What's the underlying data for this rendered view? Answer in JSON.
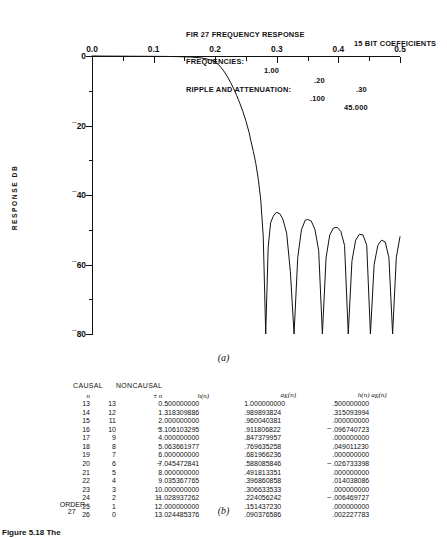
{
  "header": {
    "title": "FIR 27 FREQUENCY RESPONSE",
    "coefficients": "15 BIT COEFFICIENTS",
    "frequencies_label": "FREQUENCIES:",
    "frequencies": [
      "1.00",
      ".20",
      ".30"
    ],
    "ripple_label": "RIPPLE AND ATTENUATION:",
    "ripple": ".100",
    "attenuation": "45.000"
  },
  "figure_a_caption": "(a)",
  "figure_b_caption": "(b)",
  "bottom_caption": "Figure 5.18 The",
  "chart_data": {
    "type": "line",
    "title": "FIR 27 FREQUENCY RESPONSE",
    "xlabel": "",
    "ylabel": "RESPONSE DB",
    "xlim": [
      0.0,
      0.5
    ],
    "ylim": [
      -80,
      0
    ],
    "xticks": [
      "0.0",
      "0.1",
      "0.2",
      "0.3",
      "0.4",
      "0.5"
    ],
    "xtick_values": [
      0.0,
      0.1,
      0.2,
      0.3,
      0.4,
      0.5
    ],
    "yticks": [
      "0",
      "-20",
      "-40",
      "-60",
      "-80"
    ],
    "ytick_values": [
      0,
      -20,
      -40,
      -60,
      -80
    ],
    "grid": false,
    "legend": null,
    "passband_edge": 0.2,
    "stopband_edge": 0.3,
    "stopband_attenuation_db": -45,
    "passband_ripple_db": 0.1,
    "series": [
      {
        "name": "magnitude response",
        "x": [
          0.0,
          0.02,
          0.04,
          0.06,
          0.08,
          0.1,
          0.12,
          0.14,
          0.16,
          0.175,
          0.185,
          0.195,
          0.2,
          0.205,
          0.21,
          0.215,
          0.22,
          0.225,
          0.23,
          0.235,
          0.24,
          0.245,
          0.25,
          0.255,
          0.258,
          0.262,
          0.266,
          0.27,
          0.274,
          0.278,
          0.282,
          0.286,
          0.29,
          0.294,
          0.298,
          0.3,
          0.305,
          0.31,
          0.316,
          0.322,
          0.328,
          0.334,
          0.34,
          0.346,
          0.35,
          0.356,
          0.362,
          0.368,
          0.374,
          0.38,
          0.386,
          0.392,
          0.398,
          0.404,
          0.41,
          0.416,
          0.422,
          0.428,
          0.434,
          0.44,
          0.446,
          0.452,
          0.458,
          0.464,
          0.47,
          0.476,
          0.482,
          0.488,
          0.494,
          0.5
        ],
        "y": [
          0.0,
          -0.02,
          -0.04,
          -0.06,
          -0.08,
          -0.1,
          -0.12,
          -0.18,
          -0.3,
          -0.5,
          -0.8,
          -1.3,
          -1.7,
          -2.4,
          -3.4,
          -4.6,
          -6.0,
          -7.6,
          -9.4,
          -11.4,
          -13.6,
          -16.0,
          -18.8,
          -22.0,
          -24.5,
          -27.5,
          -31.0,
          -35.5,
          -41.5,
          -52.0,
          -80.0,
          -55.0,
          -48.0,
          -46.2,
          -45.2,
          -45.0,
          -45.4,
          -47.0,
          -51.0,
          -62.0,
          -80.0,
          -58.0,
          -50.0,
          -47.3,
          -47.0,
          -47.5,
          -50.0,
          -56.0,
          -80.0,
          -58.0,
          -51.5,
          -49.5,
          -49.3,
          -50.5,
          -54.5,
          -80.0,
          -59.0,
          -53.0,
          -51.3,
          -51.5,
          -54.5,
          -80.0,
          -60.0,
          -54.5,
          -53.0,
          -53.5,
          -58.0,
          -80.0,
          -58.0,
          -52.0
        ]
      }
    ]
  },
  "table": {
    "group_headers": [
      "CAUSAL",
      "NONCAUSAL"
    ],
    "columns": [
      "n",
      "",
      "± n",
      "h(n)",
      "aK(n)",
      "h(n) aK(n)"
    ],
    "rows": [
      {
        "n": "13",
        "n2": "13",
        "pm": "0",
        "h": ".500000000",
        "h_neg": false,
        "a": "1.000000000",
        "ha": ".500000000",
        "ha_neg": false
      },
      {
        "n": "14",
        "n2": "12",
        "pm": "1",
        "h": ".318309886",
        "h_neg": false,
        "a": ".989893824",
        "ha": ".315093994",
        "ha_neg": false
      },
      {
        "n": "15",
        "n2": "11",
        "pm": "2",
        "h": ".000000000",
        "h_neg": false,
        "a": ".960040381",
        "ha": ".000000000",
        "ha_neg": false
      },
      {
        "n": "16",
        "n2": "10",
        "pm": "3",
        "h": ".106103295",
        "h_neg": true,
        "a": ".911806822",
        "ha": ".096740723",
        "ha_neg": true
      },
      {
        "n": "17",
        "n2": "9",
        "pm": "4",
        "h": ".000000000",
        "h_neg": false,
        "a": ".847379957",
        "ha": ".000000000",
        "ha_neg": false
      },
      {
        "n": "18",
        "n2": "8",
        "pm": "5",
        "h": ".063661977",
        "h_neg": false,
        "a": ".769635258",
        "ha": ".049011230",
        "ha_neg": false
      },
      {
        "n": "19",
        "n2": "7",
        "pm": "6",
        "h": ".000000000",
        "h_neg": false,
        "a": ".681966236",
        "ha": ".000000000",
        "ha_neg": false
      },
      {
        "n": "20",
        "n2": "6",
        "pm": "7",
        "h": ".045472841",
        "h_neg": true,
        "a": ".588085846",
        "ha": ".026733398",
        "ha_neg": true
      },
      {
        "n": "21",
        "n2": "5",
        "pm": "8",
        "h": ".000000000",
        "h_neg": false,
        "a": ".491813351",
        "ha": ".000000000",
        "ha_neg": false
      },
      {
        "n": "22",
        "n2": "4",
        "pm": "9",
        "h": ".035367765",
        "h_neg": false,
        "a": ".396860858",
        "ha": ".014038086",
        "ha_neg": false
      },
      {
        "n": "23",
        "n2": "3",
        "pm": "10",
        "h": ".000000000",
        "h_neg": false,
        "a": ".306633533",
        "ha": ".000000000",
        "ha_neg": false
      },
      {
        "n": "24",
        "n2": "2",
        "pm": "11",
        "h": ".028937262",
        "h_neg": true,
        "a": ".224056242",
        "ha": ".006469727",
        "ha_neg": true
      },
      {
        "n": "25",
        "n2": "1",
        "pm": "12",
        "h": ".000000000",
        "h_neg": false,
        "a": ".151437230",
        "ha": ".000000000",
        "ha_neg": false
      },
      {
        "n": "26",
        "n2": "0",
        "pm": "13",
        "h": ".024485376",
        "h_neg": false,
        "a": ".090376586",
        "ha": ".002227783",
        "ha_neg": false
      }
    ],
    "order_label": "ORDER :",
    "order_value": "27"
  }
}
